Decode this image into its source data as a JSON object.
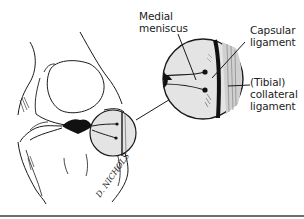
{
  "figure": {
    "labels": {
      "medial_meniscus": [
        "Medial",
        "meniscus"
      ],
      "capsular_ligament": [
        "Capsular",
        "ligament"
      ],
      "tibial_collateral_ligament": [
        "(Tibial)",
        "collateral",
        "ligament"
      ]
    },
    "signature": "D. NICHOLS",
    "colors": {
      "line": "#1a1a1a",
      "inset_fill": "#e4e4e4",
      "rule": "#6e6e6e",
      "background": "#ffffff"
    }
  }
}
